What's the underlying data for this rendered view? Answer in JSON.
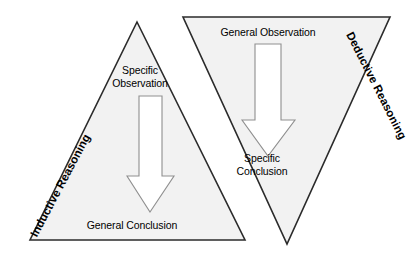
{
  "diagram": {
    "background_color": "#ffffff",
    "shape_fill": "#f2f2f2",
    "shape_stroke": "#2b2b2b",
    "arrow_fill": "#ffffff",
    "arrow_stroke": "#8f8f8f",
    "text_color": "#000000",
    "inductive": {
      "side_label": "Inductive Reasoning",
      "top_label_line1": "Specific",
      "top_label_line2": "Observation",
      "bottom_label": "General Conclusion",
      "arrow_direction": "down",
      "shape": "upright-triangle"
    },
    "deductive": {
      "side_label": "Deductive Reasoning",
      "top_label": "General Observation",
      "bottom_label_line1": "Specific",
      "bottom_label_line2": "Conclusion",
      "arrow_direction": "down",
      "shape": "inverted-triangle"
    }
  }
}
